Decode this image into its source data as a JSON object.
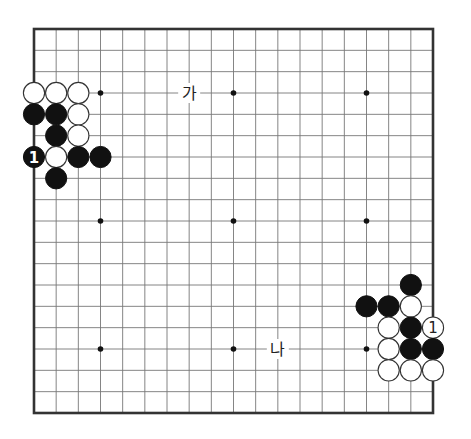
{
  "board": {
    "size": 19,
    "star_points": [
      [
        4,
        4
      ],
      [
        10,
        4
      ],
      [
        16,
        4
      ],
      [
        4,
        10
      ],
      [
        10,
        10
      ],
      [
        16,
        10
      ],
      [
        4,
        16
      ],
      [
        10,
        16
      ],
      [
        16,
        16
      ]
    ],
    "stones": [
      {
        "col": 1,
        "row": 4,
        "color": "white"
      },
      {
        "col": 2,
        "row": 4,
        "color": "white"
      },
      {
        "col": 3,
        "row": 4,
        "color": "white"
      },
      {
        "col": 1,
        "row": 5,
        "color": "black"
      },
      {
        "col": 2,
        "row": 5,
        "color": "black"
      },
      {
        "col": 3,
        "row": 5,
        "color": "white"
      },
      {
        "col": 2,
        "row": 6,
        "color": "black"
      },
      {
        "col": 3,
        "row": 6,
        "color": "white"
      },
      {
        "col": 1,
        "row": 7,
        "color": "black",
        "label": "1"
      },
      {
        "col": 2,
        "row": 7,
        "color": "white"
      },
      {
        "col": 3,
        "row": 7,
        "color": "black"
      },
      {
        "col": 4,
        "row": 7,
        "color": "black"
      },
      {
        "col": 2,
        "row": 8,
        "color": "black"
      },
      {
        "col": 18,
        "row": 13,
        "color": "black"
      },
      {
        "col": 16,
        "row": 14,
        "color": "black"
      },
      {
        "col": 17,
        "row": 14,
        "color": "black"
      },
      {
        "col": 18,
        "row": 14,
        "color": "white"
      },
      {
        "col": 17,
        "row": 15,
        "color": "white"
      },
      {
        "col": 18,
        "row": 15,
        "color": "black"
      },
      {
        "col": 19,
        "row": 15,
        "color": "white",
        "label": "1"
      },
      {
        "col": 17,
        "row": 16,
        "color": "white"
      },
      {
        "col": 18,
        "row": 16,
        "color": "black"
      },
      {
        "col": 19,
        "row": 16,
        "color": "black"
      },
      {
        "col": 17,
        "row": 17,
        "color": "white"
      },
      {
        "col": 18,
        "row": 17,
        "color": "white"
      },
      {
        "col": 19,
        "row": 17,
        "color": "white"
      }
    ],
    "markers": [
      {
        "col": 8,
        "row": 4,
        "text": "가"
      },
      {
        "col": 12,
        "row": 16,
        "text": "나"
      }
    ]
  }
}
